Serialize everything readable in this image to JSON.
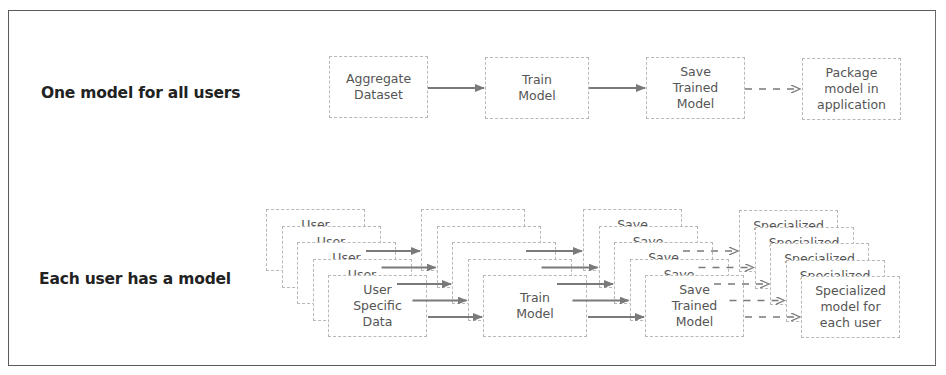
{
  "rows": {
    "single": {
      "label": "One model for all users",
      "steps": [
        "Aggregate\nDataset",
        "Train\nModel",
        "Save\nTrained\nModel",
        "Package\nmodel in\napplication"
      ],
      "connectors": [
        "solid",
        "solid",
        "dashed"
      ]
    },
    "per_user": {
      "label": "Each user has a model",
      "layer_count": 5,
      "steps": [
        "User\nSpecific\nData",
        "Train\nModel",
        "Save\nTrained\nModel",
        "Specialized\nmodel for\neach user"
      ],
      "back_layer_labels": [
        "User",
        "",
        "Save",
        "Specialized"
      ],
      "connectors": [
        "solid",
        "solid",
        "dashed"
      ]
    }
  },
  "colors": {
    "frame": "#5a5a5a",
    "box_border": "#b8b8b8",
    "arrow": "#7a7a7a",
    "label_text": "#222222",
    "box_text": "#555555"
  }
}
